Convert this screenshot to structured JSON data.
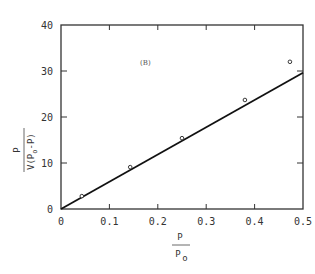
{
  "chart_data": {
    "type": "scatter",
    "title": "",
    "annotation": "(B)",
    "xlabel": {
      "numerator": "P",
      "denominator": "P",
      "denominator_sub": "o"
    },
    "ylabel": {
      "numerator": "P",
      "denominator_prefix": "V(P",
      "denominator_sub": "o",
      "denominator_suffix": "-P)"
    },
    "xlim": [
      0,
      0.5
    ],
    "ylim": [
      0,
      40
    ],
    "xticks": [
      0,
      0.1,
      0.2,
      0.3,
      0.4,
      0.5
    ],
    "xtick_labels": [
      "0",
      "0.1",
      "0.2",
      "0.3",
      "0.4",
      "0.5"
    ],
    "yticks": [
      0,
      10,
      20,
      30,
      40
    ],
    "ytick_labels": [
      "0",
      "10",
      "20",
      "30",
      "40"
    ],
    "grid": false,
    "legend": null,
    "series": [
      {
        "name": "data",
        "marker": "open-circle",
        "x": [
          0.043,
          0.143,
          0.25,
          0.38,
          0.473
        ],
        "y": [
          2.8,
          9.1,
          15.4,
          23.7,
          32.0
        ]
      },
      {
        "name": "fit-line",
        "style": "solid-line",
        "x": [
          0,
          0.5
        ],
        "y": [
          0,
          29.6
        ]
      }
    ]
  },
  "colors": {
    "axis": "#333333",
    "line": "#111111",
    "marker": "#222222"
  }
}
